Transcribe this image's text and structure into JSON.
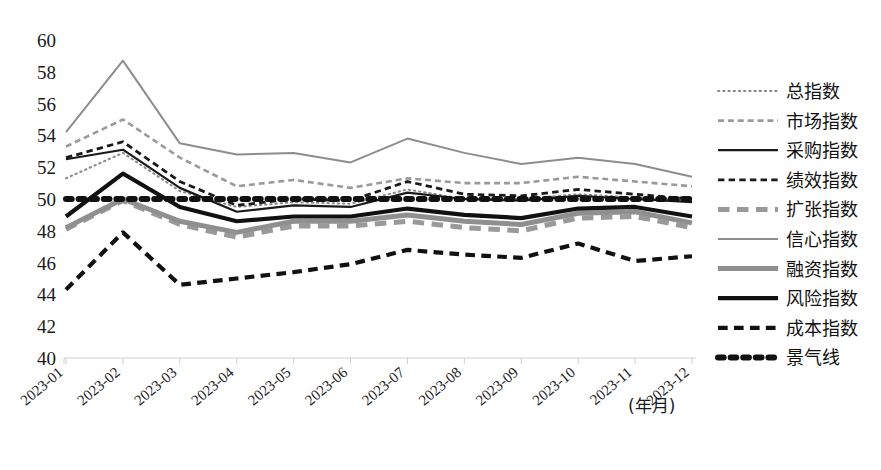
{
  "chart_data": {
    "type": "line",
    "title": "",
    "xlabel": "(年月)",
    "ylabel": "",
    "ylim": [
      40,
      60
    ],
    "ytick_step": 2,
    "grid": false,
    "legend_position": "right",
    "categories": [
      "2023-01",
      "2023-02",
      "2023-03",
      "2023-04",
      "2023-05",
      "2023-06",
      "2023-07",
      "2023-08",
      "2023-09",
      "2023-10",
      "2023-11",
      "2023-12"
    ],
    "yticks": [
      "60",
      "58",
      "56",
      "54",
      "52",
      "50",
      "48",
      "46",
      "44",
      "42",
      "40"
    ],
    "series": [
      {
        "name": "总指数",
        "style": "dotted",
        "color": "#8a8a8a",
        "width": 2,
        "values": [
          51.3,
          52.9,
          50.5,
          49.5,
          49.8,
          49.7,
          50.6,
          50.0,
          50.0,
          50.3,
          50.1,
          49.9
        ]
      },
      {
        "name": "市场指数",
        "style": "dashed",
        "color": "#9a9a9a",
        "width": 2.6,
        "values": [
          53.3,
          55.0,
          52.6,
          50.8,
          51.2,
          50.7,
          51.3,
          51.0,
          51.0,
          51.4,
          51.1,
          50.8
        ]
      },
      {
        "name": "采购指数",
        "style": "solid",
        "color": "#1a1a1a",
        "width": 2.2,
        "values": [
          52.5,
          53.1,
          50.7,
          49.2,
          49.6,
          49.5,
          50.4,
          50.0,
          49.9,
          50.2,
          50.0,
          49.8
        ]
      },
      {
        "name": "绩效指数",
        "style": "dashed",
        "color": "#1a1a1a",
        "width": 2.8,
        "values": [
          52.6,
          53.6,
          51.1,
          49.6,
          50.0,
          49.9,
          51.1,
          50.3,
          50.2,
          50.6,
          50.3,
          50.0
        ]
      },
      {
        "name": "扩张指数",
        "style": "dashed",
        "color": "#999999",
        "width": 5,
        "values": [
          48.1,
          49.9,
          48.4,
          47.6,
          48.3,
          48.3,
          48.6,
          48.2,
          48.0,
          48.8,
          48.9,
          48.2
        ]
      },
      {
        "name": "信心指数",
        "style": "solid",
        "color": "#8d8d8d",
        "width": 2,
        "values": [
          54.2,
          58.7,
          53.5,
          52.8,
          52.9,
          52.3,
          53.8,
          52.9,
          52.2,
          52.6,
          52.2,
          51.4
        ]
      },
      {
        "name": "融资指数",
        "style": "solid",
        "color": "#8f8f8f",
        "width": 5,
        "values": [
          48.2,
          50.0,
          48.6,
          47.9,
          48.6,
          48.6,
          49.0,
          48.6,
          48.4,
          49.1,
          49.2,
          48.5
        ]
      },
      {
        "name": "风险指数",
        "style": "solid",
        "color": "#111111",
        "width": 4.2,
        "values": [
          48.9,
          51.6,
          49.5,
          48.6,
          48.9,
          48.9,
          49.4,
          49.0,
          48.8,
          49.4,
          49.5,
          48.9
        ]
      },
      {
        "name": "成本指数",
        "style": "dashed",
        "color": "#111111",
        "width": 4.2,
        "values": [
          44.3,
          47.9,
          44.6,
          45.0,
          45.4,
          45.9,
          46.8,
          46.5,
          46.3,
          47.2,
          46.1,
          46.4
        ]
      },
      {
        "name": "景气线",
        "style": "dotted-thick",
        "color": "#111111",
        "width": 6,
        "values": [
          50,
          50,
          50,
          50,
          50,
          50,
          50,
          50,
          50,
          50,
          50,
          50
        ]
      }
    ]
  },
  "legend": {
    "items": [
      {
        "label": "总指数"
      },
      {
        "label": "市场指数"
      },
      {
        "label": "采购指数"
      },
      {
        "label": "绩效指数"
      },
      {
        "label": "扩张指数"
      },
      {
        "label": "信心指数"
      },
      {
        "label": "融资指数"
      },
      {
        "label": "风险指数"
      },
      {
        "label": "成本指数"
      },
      {
        "label": "景气线"
      }
    ]
  }
}
